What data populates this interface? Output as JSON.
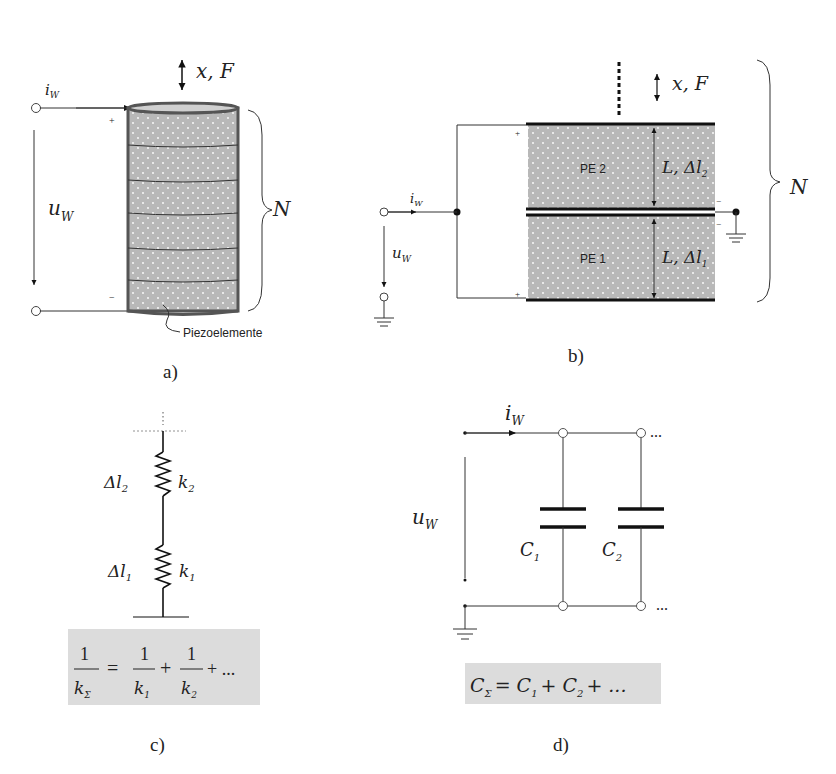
{
  "panels": {
    "a": {
      "label": "a)",
      "current": "i",
      "current_sub": "W",
      "voltage": "u",
      "voltage_sub": "W",
      "motion": "x, F",
      "stack_count": "N",
      "plus": "+",
      "minus": "−",
      "element_label": "Piezoelemente",
      "element_count": 6
    },
    "b": {
      "label": "b)",
      "current": "i",
      "current_sub": "W",
      "voltage": "u",
      "voltage_sub": "W",
      "motion": "x, F",
      "stack_count": "N",
      "pe2": "PE 2",
      "pe1": "PE 1",
      "dim2": "L, Δl",
      "dim2_sub": "2",
      "dim1": "L, Δl",
      "dim1_sub": "1",
      "plus": "+",
      "minus": "−"
    },
    "c": {
      "label": "c)",
      "spring2_disp": "Δl",
      "spring2_disp_sub": "2",
      "spring2_k": "k",
      "spring2_k_sub": "2",
      "spring1_disp": "Δl",
      "spring1_disp_sub": "1",
      "spring1_k": "k",
      "spring1_k_sub": "1",
      "formula": {
        "lhs_num": "1",
        "lhs_den": "k",
        "lhs_den_sub": "Σ",
        "eq": "=",
        "t1_num": "1",
        "t1_den": "k",
        "t1_den_sub": "1",
        "plus1": "+",
        "t2_num": "1",
        "t2_den": "k",
        "t2_den_sub": "2",
        "tail": "+ ..."
      }
    },
    "d": {
      "label": "d)",
      "current": "i",
      "current_sub": "W",
      "voltage": "u",
      "voltage_sub": "W",
      "cap1": "C",
      "cap1_sub": "1",
      "cap2": "C",
      "cap2_sub": "2",
      "ellipsis": "...",
      "formula": {
        "lhs": "C",
        "lhs_sub": "Σ",
        "rhs": "= C",
        "rhs_sub1": "1",
        "mid": "+ C",
        "rhs_sub2": "2",
        "tail": "+ ..."
      }
    }
  },
  "colors": {
    "piezo_fill": "#b8b8b8",
    "piezo_border": "#555555",
    "formula_bg": "#dcdcdc",
    "line": "#222222"
  }
}
